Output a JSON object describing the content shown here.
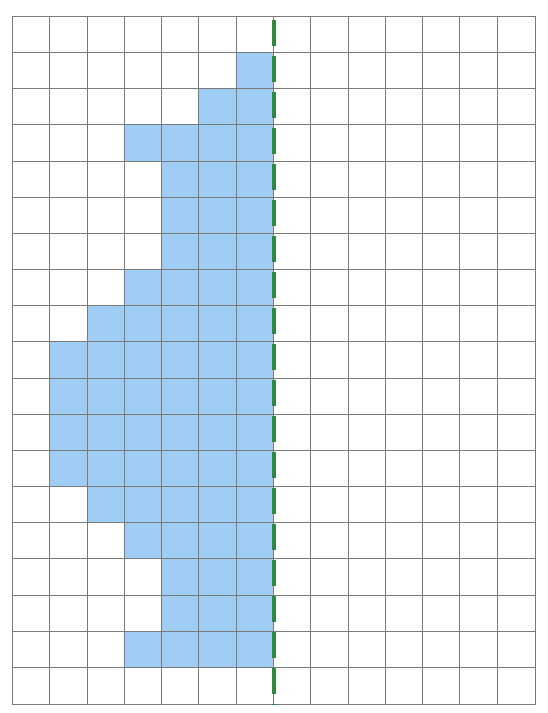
{
  "figure": {
    "type": "grid-symmetry-diagram",
    "grid": {
      "columns": 14,
      "rows": 19,
      "line_color": "#7a7a7a",
      "empty_color": "#ffffff"
    },
    "shape": {
      "fill_color": "#9fcdf3",
      "side": "left-of-line",
      "filled_cells_by_row": [
        [],
        [
          6
        ],
        [
          5,
          6
        ],
        [
          3,
          4,
          5,
          6
        ],
        [
          4,
          5,
          6
        ],
        [
          4,
          5,
          6
        ],
        [
          4,
          5,
          6
        ],
        [
          3,
          4,
          5,
          6
        ],
        [
          2,
          3,
          4,
          5,
          6
        ],
        [
          1,
          2,
          3,
          4,
          5,
          6
        ],
        [
          1,
          2,
          3,
          4,
          5,
          6
        ],
        [
          1,
          2,
          3,
          4,
          5,
          6
        ],
        [
          1,
          2,
          3,
          4,
          5,
          6
        ],
        [
          2,
          3,
          4,
          5,
          6
        ],
        [
          3,
          4,
          5,
          6
        ],
        [
          4,
          5,
          6
        ],
        [
          4,
          5,
          6
        ],
        [
          3,
          4,
          5,
          6
        ],
        []
      ]
    },
    "symmetry_line": {
      "orientation": "vertical",
      "after_column": 7,
      "style": "dashed",
      "color": "#2e8b3e",
      "dash_length": 26,
      "gap_length": 10
    }
  }
}
